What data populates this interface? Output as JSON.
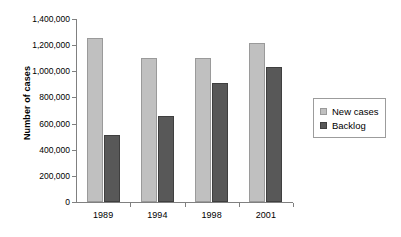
{
  "chart_data": {
    "type": "bar",
    "title": "",
    "xlabel": "",
    "ylabel": "Number of cases",
    "categories": [
      "1989",
      "1994",
      "1998",
      "2001"
    ],
    "series": [
      {
        "name": "New cases",
        "color": "#c0c0c0",
        "values": [
          1255000,
          1105000,
          1100000,
          1215000
        ]
      },
      {
        "name": "Backlog",
        "color": "#585858",
        "values": [
          510000,
          655000,
          910000,
          1035000
        ]
      }
    ],
    "ylim": [
      0,
      1400000
    ],
    "ytick_step": 200000,
    "ytick_labels": [
      "0",
      "200,000",
      "400,000",
      "600,000",
      "800,000",
      "1,000,000",
      "1,200,000",
      "1,400,000"
    ],
    "ytick_values": [
      0,
      200000,
      400000,
      600000,
      800000,
      1000000,
      1200000,
      1400000
    ],
    "grid": false,
    "legend_position": "right"
  }
}
